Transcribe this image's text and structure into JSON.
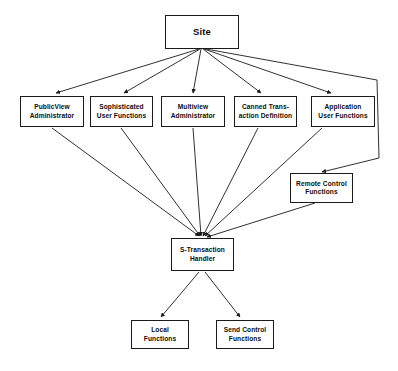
{
  "diagram": {
    "background_color": "#ffffff",
    "stroke_color": "#1a1a1a",
    "nodes": {
      "site": {
        "label": "Site"
      },
      "public_view_administrator": {
        "label": "PublicView\nAdministrator"
      },
      "sophisticated_user_functions": {
        "label": "Sophisticated\nUser Functions"
      },
      "multiview_administrator": {
        "label": "Multiview\nAdministrator"
      },
      "canned_transaction_definition": {
        "label": "Canned Trans-\naction Definition"
      },
      "application_user_functions": {
        "label": "Application\nUser Functions"
      },
      "remote_control_functions": {
        "label": "Remote Control\nFunctions"
      },
      "s_transaction_handler": {
        "label": "S-Transaction\nHandler"
      },
      "local_functions": {
        "label": "Local\nFunctions"
      },
      "send_control_functions": {
        "label": "Send Control\nFunctions"
      }
    },
    "edges": [
      {
        "from": "site",
        "to": "public_view_administrator"
      },
      {
        "from": "site",
        "to": "sophisticated_user_functions"
      },
      {
        "from": "site",
        "to": "multiview_administrator"
      },
      {
        "from": "site",
        "to": "canned_transaction_definition"
      },
      {
        "from": "site",
        "to": "application_user_functions"
      },
      {
        "from": "site",
        "to": "remote_control_functions"
      },
      {
        "from": "public_view_administrator",
        "to": "s_transaction_handler"
      },
      {
        "from": "sophisticated_user_functions",
        "to": "s_transaction_handler"
      },
      {
        "from": "multiview_administrator",
        "to": "s_transaction_handler"
      },
      {
        "from": "canned_transaction_definition",
        "to": "s_transaction_handler"
      },
      {
        "from": "application_user_functions",
        "to": "s_transaction_handler"
      },
      {
        "from": "remote_control_functions",
        "to": "s_transaction_handler"
      },
      {
        "from": "s_transaction_handler",
        "to": "local_functions"
      },
      {
        "from": "s_transaction_handler",
        "to": "send_control_functions"
      }
    ]
  }
}
